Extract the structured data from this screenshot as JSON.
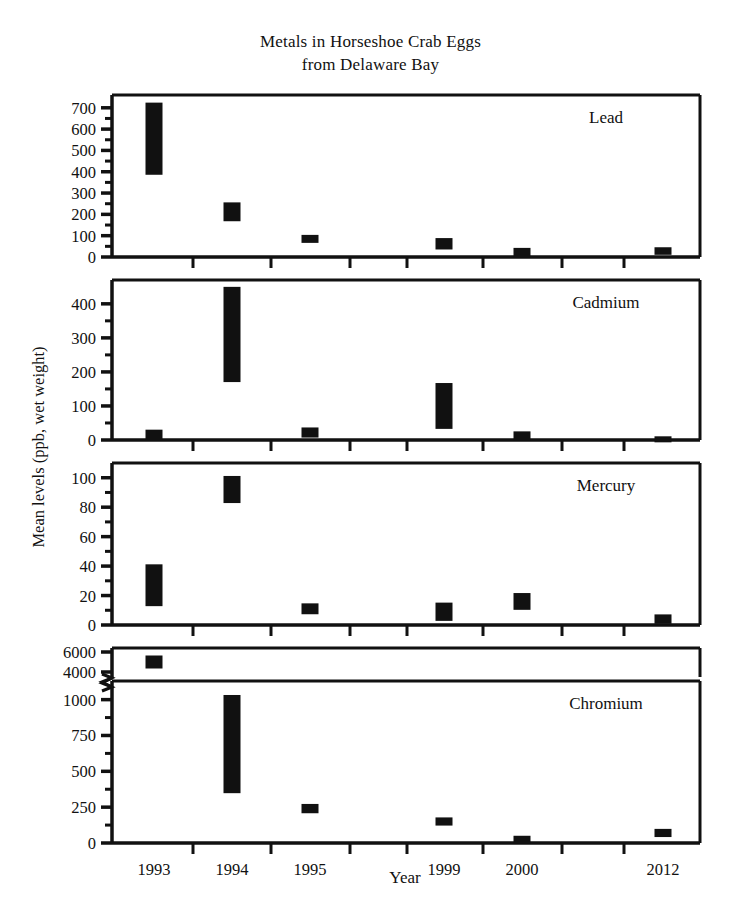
{
  "title": {
    "line1": "Metals in Horseshoe Crab Eggs",
    "line2": "from Delaware Bay"
  },
  "axes": {
    "ylabel": "Mean levels (ppb, wet weight)",
    "xlabel": "Year"
  },
  "chart_data": {
    "type": "scatter",
    "title": "Metals in Horseshoe Crab Eggs from Delaware Bay",
    "xlabel": "Year",
    "ylabel": "Mean levels (ppb, wet weight)",
    "grid": false,
    "legend": "none",
    "error_bars": "mean with upper and lower whiskers",
    "categories": [
      "1993",
      "1994",
      "1995",
      "1999",
      "2000",
      "2012"
    ],
    "panels": [
      {
        "name": "Lead",
        "ylim": [
          0,
          760
        ],
        "yticks": [
          0,
          100,
          200,
          300,
          400,
          500,
          600,
          700
        ],
        "yticklabels": [
          "0",
          "100",
          "200",
          "300",
          "400",
          "500",
          "600",
          "700"
        ],
        "values": [
          555,
          212,
          85,
          62,
          20,
          28
        ],
        "lower": [
          400,
          180,
          78,
          48,
          10,
          22
        ],
        "upper": [
          715,
          245,
          92,
          78,
          32,
          34
        ]
      },
      {
        "name": "Cadmium",
        "ylim": [
          0,
          470
        ],
        "yticks": [
          0,
          100,
          200,
          300,
          400
        ],
        "yticklabels": [
          "0",
          "100",
          "200",
          "300",
          "400"
        ],
        "values": [
          15,
          310,
          22,
          100,
          12,
          2
        ],
        "lower": [
          8,
          175,
          15,
          40,
          6,
          1
        ],
        "upper": [
          24,
          440,
          30,
          160,
          18,
          4
        ]
      },
      {
        "name": "Mercury",
        "ylim": [
          0,
          110
        ],
        "yticks": [
          0,
          20,
          40,
          60,
          80,
          100
        ],
        "yticklabels": [
          "0",
          "20",
          "40",
          "60",
          "80",
          "100"
        ],
        "values": [
          27,
          92,
          11,
          9,
          16,
          4
        ],
        "lower": [
          14,
          85,
          9,
          5,
          12,
          3
        ],
        "upper": [
          39,
          100,
          13,
          14,
          20,
          6
        ]
      },
      {
        "name": "Chromium",
        "broken_axis": true,
        "upper_segment": {
          "ylim": [
            3500,
            6400
          ],
          "yticks": [
            4000,
            6000
          ],
          "yticklabels": [
            "4000",
            "6000"
          ],
          "values": [
            5000
          ],
          "lower": [
            4650
          ],
          "upper": [
            5450
          ]
        },
        "ylim": [
          0,
          1130
        ],
        "yticks": [
          0,
          250,
          500,
          750,
          1000
        ],
        "yticklabels": [
          "0",
          "250",
          "500",
          "750",
          "1000"
        ],
        "values": [
          null,
          690,
          240,
          150,
          25,
          70
        ],
        "lower": [
          null,
          400,
          225,
          140,
          18,
          60
        ],
        "upper": [
          null,
          1050,
          255,
          162,
          34,
          82
        ]
      }
    ]
  }
}
